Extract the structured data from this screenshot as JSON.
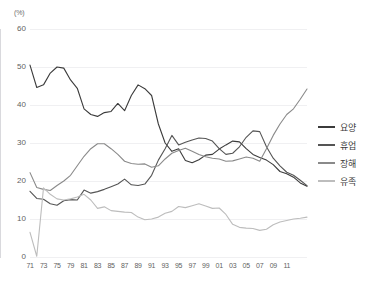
{
  "chart_data": {
    "type": "line",
    "title": "",
    "ylabel": "(%)",
    "xlabel": "",
    "ylim": [
      0,
      60
    ],
    "yticks": [
      0,
      10,
      20,
      30,
      40,
      50,
      60
    ],
    "grid": true,
    "legend_position": "right",
    "x": [
      1971,
      1972,
      1973,
      1974,
      1975,
      1976,
      1977,
      1978,
      1979,
      1980,
      1981,
      1982,
      1983,
      1984,
      1985,
      1986,
      1987,
      1988,
      1989,
      1990,
      1991,
      1992,
      1993,
      1994,
      1995,
      1996,
      1997,
      1998,
      1999,
      2000,
      2001,
      2002,
      2003,
      2004,
      2005,
      2006,
      2007,
      2008,
      2009,
      2010,
      2011,
      2012
    ],
    "xtick_labels": [
      "71",
      "73",
      "75",
      "79",
      "81",
      "83",
      "85",
      "87",
      "89",
      "91",
      "93",
      "95",
      "97",
      "99",
      "01",
      "03",
      "05",
      "07",
      "09",
      "11"
    ],
    "xtick_years": [
      1971,
      1973,
      1975,
      1977,
      1979,
      1981,
      1983,
      1985,
      1987,
      1989,
      1991,
      1993,
      1995,
      1997,
      1999,
      2001,
      2003,
      2005,
      2007,
      2009,
      2011
    ],
    "series": [
      {
        "name": "요양",
        "color": "#3b3b3b",
        "values": [
          50.5,
          44.6,
          45.3,
          48.4,
          50.0,
          49.7,
          46.6,
          44.4,
          39.0,
          37.5,
          37.0,
          38.0,
          38.3,
          40.4,
          38.5,
          42.5,
          45.3,
          44.3,
          42.5,
          35.0,
          30.0,
          27.8,
          28.5,
          25.4,
          24.8,
          25.6,
          26.8,
          27.0,
          28.4,
          29.5,
          30.5,
          30.3,
          28.5,
          27.0,
          26.2,
          25.5,
          24.3,
          22.5,
          21.9,
          21.0,
          19.5,
          18.6
        ]
      },
      {
        "name": "휴업",
        "color": "#555555",
        "values": [
          17.3,
          15.4,
          15.2,
          14.0,
          13.6,
          14.8,
          15.1,
          15.0,
          17.6,
          16.8,
          17.2,
          17.8,
          18.5,
          19.2,
          20.5,
          19.0,
          18.8,
          19.2,
          21.5,
          25.5,
          28.5,
          32.0,
          29.5,
          30.2,
          30.8,
          31.3,
          31.2,
          30.5,
          28.5,
          27.0,
          27.3,
          29.0,
          31.5,
          33.2,
          33.0,
          29.0,
          26.0,
          24.0,
          22.3,
          21.5,
          20.2,
          18.8
        ]
      },
      {
        "name": "장해",
        "color": "#8a8a8a",
        "values": [
          22.2,
          18.3,
          17.8,
          17.5,
          18.8,
          20.0,
          21.5,
          24.0,
          26.5,
          28.5,
          29.8,
          29.8,
          28.5,
          27.0,
          25.2,
          24.6,
          24.4,
          24.5,
          23.6,
          24.0,
          25.8,
          27.3,
          28.0,
          28.6,
          27.8,
          27.0,
          26.4,
          26.0,
          25.8,
          25.2,
          25.3,
          25.8,
          26.3,
          26.0,
          25.2,
          28.5,
          32.0,
          35.0,
          37.5,
          39.0,
          41.5,
          44.2
        ]
      },
      {
        "name": "유족",
        "color": "#bdbdbd",
        "values": [
          6.5,
          0.2,
          18.2,
          16.5,
          15.3,
          15.0,
          15.3,
          15.8,
          16.5,
          15.0,
          12.8,
          13.2,
          12.2,
          12.0,
          11.8,
          11.7,
          10.5,
          9.8,
          10.0,
          10.5,
          11.5,
          12.0,
          13.3,
          13.0,
          13.5,
          14.0,
          13.4,
          12.8,
          12.9,
          11.2,
          8.6,
          7.8,
          7.6,
          7.5,
          7.0,
          7.3,
          8.5,
          9.2,
          9.6,
          10.0,
          10.2,
          10.5
        ]
      }
    ]
  },
  "legend": {
    "items": [
      {
        "label": "요양",
        "color": "#3b3b3b"
      },
      {
        "label": "휴업",
        "color": "#555555"
      },
      {
        "label": "장해",
        "color": "#8a8a8a"
      },
      {
        "label": "유족",
        "color": "#bdbdbd"
      }
    ]
  },
  "axis": {
    "unit_label": "(%)"
  }
}
